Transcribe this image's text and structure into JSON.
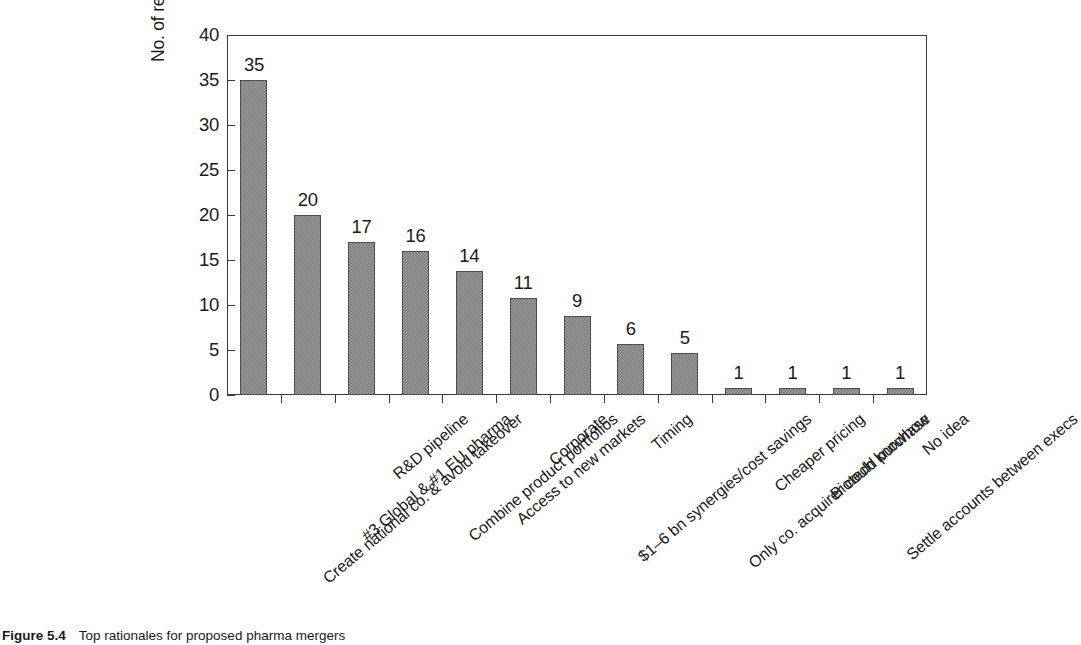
{
  "chart_data": {
    "type": "bar",
    "title": "",
    "xlabel": "",
    "ylabel": "No. of respondents citing rationale",
    "ylim": [
      0,
      40
    ],
    "ytick_values": [
      40,
      35,
      30,
      25,
      20,
      15,
      10,
      5,
      0
    ],
    "ytick_labels": [
      "40",
      "35",
      "30",
      "25",
      "20",
      "15",
      "10",
      "5",
      "0"
    ],
    "ytick_step": 5,
    "grid": false,
    "legend": null,
    "bar_color": "#808080",
    "bar_edge_color": "#4d4d4d",
    "axis_color": "#3a3a3a",
    "categories": [
      "Create national co. & avoid  takeover",
      "#3 Global & #1 EU pharma",
      "R&D pipeline",
      "Combine product portfolios",
      "Access to new markets",
      "Corporate",
      "$1–6 bn synergies/cost savings",
      "Timing",
      "Only co. acquirer could purchase",
      "Cheaper pricing",
      "Biotech knowhow",
      "Settle accounts between execs",
      "No idea"
    ],
    "values": [
      35,
      20,
      17,
      16,
      14,
      11,
      9,
      6,
      5,
      1,
      1,
      1,
      1
    ],
    "value_labels": [
      "35",
      "20",
      "17",
      "16",
      "14",
      "11",
      "9",
      "6",
      "5",
      "1",
      "1",
      "1",
      "1"
    ],
    "drawn_heights": [
      35,
      20,
      17,
      16,
      13.8,
      10.8,
      8.8,
      5.7,
      4.7,
      0.8,
      0.8,
      0.8,
      0.8
    ]
  },
  "caption": {
    "label": "Figure 5.4",
    "text": "Top rationales for proposed pharma mergers"
  }
}
